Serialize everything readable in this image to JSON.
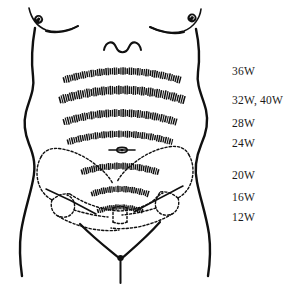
{
  "figure": {
    "background_color": "#ffffff",
    "ink_color": "#101010",
    "width": 296,
    "height": 291
  },
  "labels": {
    "items": [
      {
        "id": "w36",
        "text": "36W",
        "x": 232,
        "y": 66,
        "band": "band-36w"
      },
      {
        "id": "w32_40",
        "text": "32W, 40W",
        "x": 232,
        "y": 95,
        "band": "band-32w-40w"
      },
      {
        "id": "w28",
        "text": "28W",
        "x": 232,
        "y": 118,
        "band": "band-28w"
      },
      {
        "id": "w24",
        "text": "24W",
        "x": 232,
        "y": 138,
        "band": "band-24w"
      },
      {
        "id": "w20",
        "text": "20W",
        "x": 232,
        "y": 170,
        "band": "band-20w"
      },
      {
        "id": "w16",
        "text": "16W",
        "x": 232,
        "y": 192,
        "band": "band-16w"
      },
      {
        "id": "w12",
        "text": "12W",
        "x": 232,
        "y": 212,
        "band": "band-12w"
      }
    ]
  },
  "bands": {
    "items": [
      {
        "id": "band-36w",
        "week": "36W",
        "cx": 122,
        "cy": 71,
        "half_width": 58,
        "rise": 9,
        "tick_len": 7.5,
        "count": 56
      },
      {
        "id": "band-32w-40w",
        "week": "32W, 40W",
        "cx": 122,
        "cy": 90,
        "half_width": 62,
        "rise": 10,
        "tick_len": 9,
        "count": 60
      },
      {
        "id": "band-28w",
        "week": "28W",
        "cx": 120,
        "cy": 113,
        "half_width": 56,
        "rise": 9,
        "tick_len": 8,
        "count": 54
      },
      {
        "id": "band-24w",
        "week": "24W",
        "cx": 120,
        "cy": 134,
        "half_width": 52,
        "rise": 8,
        "tick_len": 7,
        "count": 50
      },
      {
        "id": "band-20w",
        "week": "20W",
        "cx": 120,
        "cy": 166,
        "half_width": 38,
        "rise": 6,
        "tick_len": 7,
        "count": 38
      },
      {
        "id": "band-16w",
        "week": "16W",
        "cx": 120,
        "cy": 189,
        "half_width": 28,
        "rise": 5,
        "tick_len": 6.5,
        "count": 29
      },
      {
        "id": "band-12w",
        "week": "12W",
        "cx": 120,
        "cy": 207,
        "half_width": 22,
        "rise": 4,
        "tick_len": 5.5,
        "count": 23
      }
    ]
  },
  "anatomy": {
    "navel": {
      "id": "navel",
      "cx": 122,
      "cy": 150,
      "rx": 13,
      "ry": 2.4
    },
    "xiphoid_wave": {
      "id": "xiphoid-wave",
      "cx": 122,
      "cy": 46
    },
    "left_nipple": {
      "cx": 38,
      "cy": 20
    },
    "right_nipple": {
      "cx": 192,
      "cy": 18
    },
    "pelvis_style": "dashed",
    "torso_style": "solid"
  }
}
